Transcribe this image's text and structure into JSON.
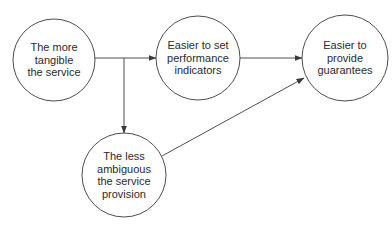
{
  "diagram": {
    "type": "flow",
    "colors": {
      "stroke": "#3a3a3a",
      "text": "#2a2a2a",
      "background": "#ffffff"
    },
    "nodes": [
      {
        "id": "tangible",
        "lines": [
          "The more",
          "tangible",
          "the service"
        ]
      },
      {
        "id": "performance",
        "lines": [
          "Easier to set",
          "performance",
          "indicators"
        ]
      },
      {
        "id": "guarantees",
        "lines": [
          "Easier to",
          "provide",
          "guarantees"
        ]
      },
      {
        "id": "ambiguous",
        "lines": [
          "The less",
          "ambiguous",
          "the service",
          "provision"
        ]
      }
    ],
    "edges": [
      {
        "from": "tangible",
        "to": "performance"
      },
      {
        "from": "tangible",
        "to": "ambiguous"
      },
      {
        "from": "performance",
        "to": "guarantees"
      },
      {
        "from": "ambiguous",
        "to": "guarantees"
      }
    ]
  }
}
